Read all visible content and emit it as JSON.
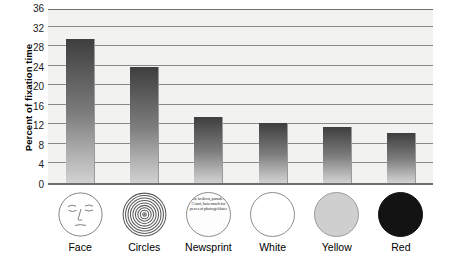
{
  "chart_data": {
    "type": "bar",
    "title": "",
    "xlabel": "",
    "ylabel": "Percent of fixation time",
    "categories": [
      "Face",
      "Circles",
      "Newsprint",
      "White",
      "Yellow",
      "Red"
    ],
    "values": [
      29.5,
      23.8,
      13.5,
      12.2,
      11.5,
      10.3
    ],
    "ylim": [
      0,
      36
    ],
    "yticks": [
      0,
      4,
      8,
      12,
      16,
      20,
      24,
      28,
      32,
      36
    ],
    "ytick_labels": [
      "0",
      "4",
      "8",
      "12",
      "16",
      "20",
      "24",
      "28",
      "32",
      "36"
    ],
    "grid": true,
    "legend": false,
    "series": [
      {
        "name": "Percent of fixation time",
        "values": [
          29.5,
          23.8,
          13.5,
          12.2,
          11.5,
          10.3
        ]
      }
    ]
  },
  "axis": {
    "y_title": "Percent of fixation time"
  },
  "stimuli": [
    {
      "key": "face",
      "icon_name": "face-stimulus-icon",
      "label": "Face",
      "fill": "#ffffff"
    },
    {
      "key": "circles",
      "icon_name": "concentric-circles-stimulus-icon",
      "label": "Circles",
      "fill": "#ffffff"
    },
    {
      "key": "newsprint",
      "icon_name": "newsprint-stimulus-icon",
      "label": "Newsprint",
      "fill": "#fdfdfd",
      "text": "table in dova, parade tre Court, hois much for pers s of photogr klater"
    },
    {
      "key": "white",
      "icon_name": "white-disc-stimulus-icon",
      "label": "White",
      "fill": "#ffffff"
    },
    {
      "key": "yellow",
      "icon_name": "yellow-disc-stimulus-icon",
      "label": "Yellow",
      "fill": "#cfcfcf"
    },
    {
      "key": "red",
      "icon_name": "red-disc-stimulus-icon",
      "label": "Red",
      "fill": "#131313"
    }
  ],
  "colors": {
    "plot_background": "#f2f2f0",
    "gridline": "#8a8a8a",
    "axis": "#6e6e6e",
    "bar_top": "#3e3e3e",
    "bar_bottom": "#d2d2d2"
  }
}
